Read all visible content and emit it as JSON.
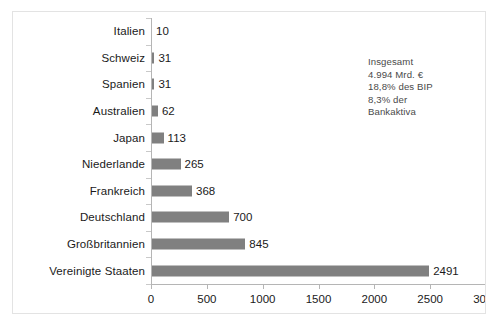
{
  "chart_data": {
    "type": "bar",
    "orientation": "horizontal",
    "title": "",
    "subtitle": "",
    "xlabel": "",
    "ylabel": "",
    "categories": [
      "Italien",
      "Schweiz",
      "Spanien",
      "Australien",
      "Japan",
      "Niederlande",
      "Frankreich",
      "Deutschland",
      "Großbritannien",
      "Vereinigte Staaten"
    ],
    "values": [
      10,
      31,
      31,
      62,
      113,
      265,
      368,
      700,
      845,
      2491
    ],
    "value_labels": [
      "10",
      "31",
      "31",
      "62",
      "113",
      "265",
      "368",
      "700",
      "845",
      "2491"
    ],
    "xlim": [
      0,
      3000
    ],
    "xticks": [
      0,
      500,
      1000,
      1500,
      2000,
      2500,
      3000
    ],
    "xtick_labels": [
      "0",
      "500",
      "1000",
      "1500",
      "2000",
      "2500",
      "3000"
    ],
    "grid": false,
    "legend": null,
    "bar_color": "#808080",
    "axis_color": "#b5b5b5",
    "text_color": "#1a1a1a",
    "background_color": "#ffffff",
    "border_color": "#e3e3e3"
  },
  "annotation": {
    "lines": [
      "Insgesamt",
      "4.994 Mrd. €",
      "18,8% des BIP",
      "8,3% der",
      "Bankaktiva"
    ]
  }
}
